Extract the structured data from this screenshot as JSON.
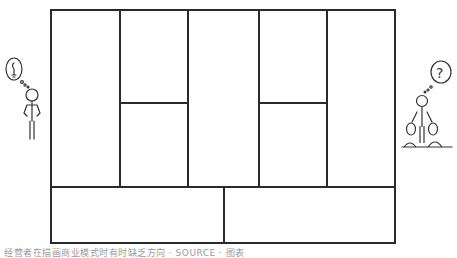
{
  "canvas": {
    "title": "Business Model Canvas (blank)",
    "line_color": "#2a2a2a",
    "background": "#ffffff"
  },
  "blocks": [
    {
      "id": "key-partners",
      "label": ""
    },
    {
      "id": "key-activities",
      "label": ""
    },
    {
      "id": "key-resources",
      "label": ""
    },
    {
      "id": "value-propositions",
      "label": ""
    },
    {
      "id": "customer-relationships",
      "label": ""
    },
    {
      "id": "channels",
      "label": ""
    },
    {
      "id": "customer-segments",
      "label": ""
    },
    {
      "id": "cost-structure",
      "label": ""
    },
    {
      "id": "revenue-streams",
      "label": ""
    }
  ],
  "figures": {
    "left": {
      "icon": "lightbulb-thought-person-icon",
      "bubble_symbol": "💡"
    },
    "right": {
      "icon": "question-money-person-icon",
      "bubble_symbol": "?"
    }
  },
  "caption": {
    "text": "经营者在描画商业模式时有时缺乏方向 · SOURCE ·  图表"
  }
}
